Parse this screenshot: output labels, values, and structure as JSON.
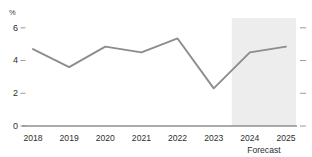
{
  "chart_data": {
    "type": "line",
    "title": "",
    "subtitle": "",
    "xlabel": "",
    "ylabel": "%",
    "unit_label": "%",
    "categories": [
      "2018",
      "2019",
      "2020",
      "2021",
      "2022",
      "2023",
      "2024",
      "2025"
    ],
    "values": [
      4.7,
      3.6,
      4.85,
      4.5,
      5.35,
      2.3,
      4.5,
      4.85
    ],
    "series": [
      {
        "name": "",
        "values": [
          4.7,
          3.6,
          4.85,
          4.5,
          5.35,
          2.3,
          4.5,
          4.85
        ]
      }
    ],
    "ylim": [
      0,
      6.6
    ],
    "ytick_values": [
      0,
      2,
      4,
      6
    ],
    "ytick_labels": [
      "0",
      "2",
      "4",
      "6"
    ],
    "xtick_labels": [
      "2018",
      "2019",
      "2020",
      "2021",
      "2022",
      "2023",
      "2024",
      "2025"
    ],
    "grid": false,
    "legend": false,
    "legend_position": "none",
    "annotations": [
      {
        "text": "Forecast",
        "start_category": "2023",
        "end_category": "2025",
        "type": "shaded-region-label"
      }
    ],
    "forecast_region": {
      "label": "Forecast",
      "from_value": 2023.5,
      "to_value": 2025,
      "shading_color": "#ededed"
    },
    "colors": {
      "line": "#8d8d8d",
      "axis": "#8f8f8f",
      "tick": "#9a9a9a",
      "text": "#2e2e2e",
      "forecast_band": "#ededed",
      "background": "#ffffff"
    }
  }
}
